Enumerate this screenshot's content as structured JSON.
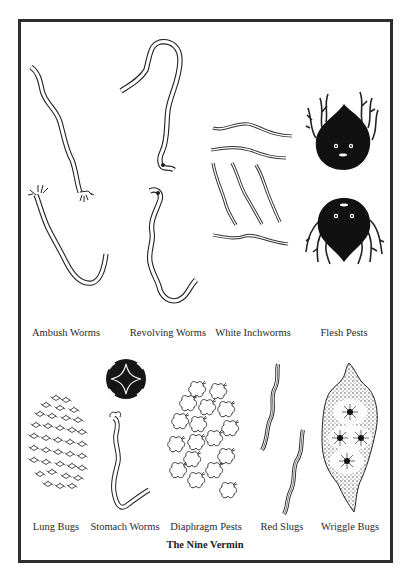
{
  "figure": {
    "title": "The Nine Vermin",
    "top_row": [
      {
        "label": "Ambush Worms"
      },
      {
        "label": "Revolving Worms"
      },
      {
        "label": "White Inchworms"
      },
      {
        "label": "Flesh Pests"
      }
    ],
    "bottom_row": [
      {
        "label": "Lung Bugs"
      },
      {
        "label": "Stomach Worms"
      },
      {
        "label": "Diaphragm Pests"
      },
      {
        "label": "Red Slugs"
      },
      {
        "label": "Wriggle Bugs"
      }
    ]
  },
  "colors": {
    "ink": "#222222",
    "frame": "#2e2e2e",
    "paper": "#ffffff"
  }
}
